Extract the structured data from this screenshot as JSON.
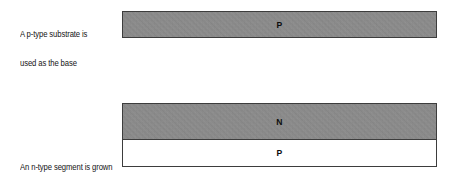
{
  "figure": {
    "background_color": "#ffffff",
    "steps": [
      {
        "id": "substrate",
        "caption_line1": "A p-type substrate is",
        "caption_line2": "used as the base",
        "layers": [
          {
            "id": "substrate-p",
            "label": "P",
            "material": "p-type substrate",
            "fill": "gray",
            "fill_color": "#8c8c8c",
            "border_color": "#3d3d3d"
          }
        ]
      },
      {
        "id": "epitaxial",
        "caption_line1": "An n-type segment is grown",
        "caption_line2": "epitaxially on the substrate",
        "layers": [
          {
            "id": "epi-n",
            "label": "N",
            "material": "n-type epitaxial layer",
            "fill": "gray",
            "fill_color": "#8c8c8c",
            "border_color": "#3d3d3d"
          },
          {
            "id": "epi-p",
            "label": "P",
            "material": "p-type substrate",
            "fill": "white",
            "fill_color": "#ffffff",
            "border_color": "#3d3d3d"
          }
        ]
      }
    ]
  }
}
